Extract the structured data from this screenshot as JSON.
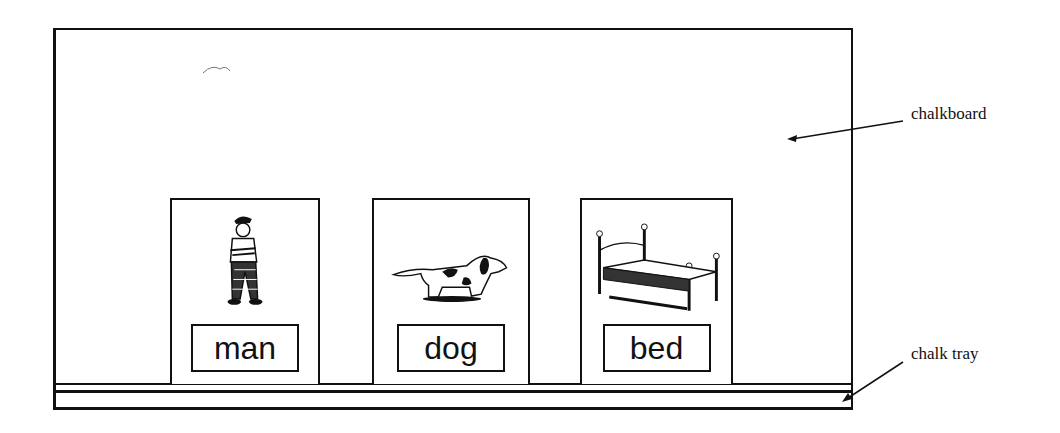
{
  "labels": {
    "chalkboard": "chalkboard",
    "chalk_tray": "chalk tray"
  },
  "cards": [
    {
      "word": "man",
      "picture": "man-icon"
    },
    {
      "word": "dog",
      "picture": "dog-icon"
    },
    {
      "word": "bed",
      "picture": "bed-icon"
    }
  ]
}
